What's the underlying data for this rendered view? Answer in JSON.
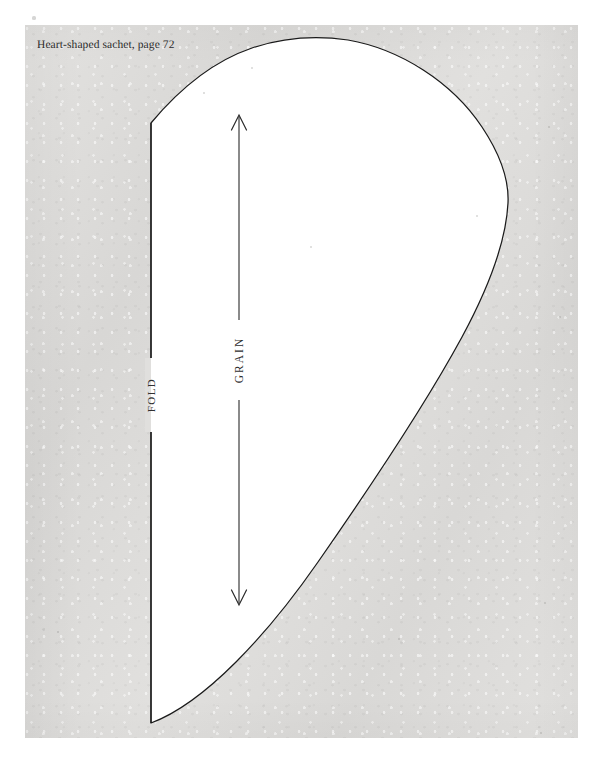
{
  "page": {
    "caption": "Heart-shaped sachet, page 72",
    "background_color": "#ffffff",
    "sheet_color": "#dddcda",
    "ink_color": "#1a1a1a",
    "shape_fill": "#ffffff"
  },
  "pattern": {
    "name": "heart-shaped-sachet-half-pattern",
    "fold_label": "FOLD",
    "grain_label": "GRAIN",
    "fold_edge": {
      "top_point": "151,123",
      "bottom_point": "151,723"
    },
    "apex_point": "335,38",
    "widest_point": "508,200",
    "grain_arrow": {
      "x": 239,
      "top_y": 115,
      "bottom_y": 605,
      "double_headed": true
    }
  },
  "specks": [
    {
      "x": 34,
      "y": 18,
      "r": 1.6
    },
    {
      "x": 549,
      "y": 127,
      "r": 1.4
    },
    {
      "x": 477,
      "y": 216,
      "r": 1.2
    },
    {
      "x": 252,
      "y": 68,
      "r": 1.1
    },
    {
      "x": 311,
      "y": 247,
      "r": 1.0
    },
    {
      "x": 560,
      "y": 317,
      "r": 1.3
    },
    {
      "x": 43,
      "y": 629,
      "r": 1.5
    },
    {
      "x": 545,
      "y": 603,
      "r": 1.2
    },
    {
      "x": 541,
      "y": 733,
      "r": 1.1
    },
    {
      "x": 204,
      "y": 93,
      "r": 0.9
    },
    {
      "x": 399,
      "y": 639,
      "r": 1.0
    },
    {
      "x": 58,
      "y": 632,
      "r": 1.0
    }
  ]
}
